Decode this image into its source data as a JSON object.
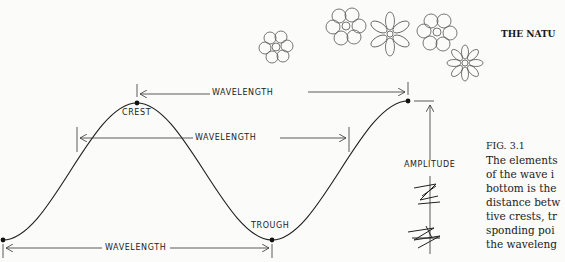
{
  "header": {
    "running_title": "THE NATU"
  },
  "diagram": {
    "labels": {
      "crest": "CREST",
      "trough": "TROUGH",
      "amplitude": "AMPLITUDE",
      "wavelength_top": "WAVELENGTH",
      "wavelength_middle": "WAVELENGTH",
      "wavelength_bottom": "WAVELENGTH"
    },
    "line_color": "#1e1e1e"
  },
  "caption": {
    "figure": "FIG. 3.1",
    "lines": [
      "The elements",
      "of the wave i",
      "bottom is the",
      "distance betw",
      "tive crests, tr",
      "sponding poi",
      "the waveleng"
    ]
  }
}
